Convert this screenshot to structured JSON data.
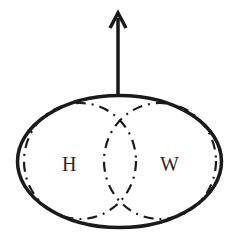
{
  "diagram": {
    "labels": {
      "left_set": "H",
      "right_set": "W"
    },
    "colors": {
      "stroke": "#1a1a1a",
      "background": "#ffffff"
    },
    "elements": {
      "arrow": "upward arrow from top of outer ellipse",
      "outer_ellipse": "solid outline enclosing both sets",
      "left_set": "dash-dot ellipse",
      "right_set": "dash-dot ellipse"
    }
  }
}
